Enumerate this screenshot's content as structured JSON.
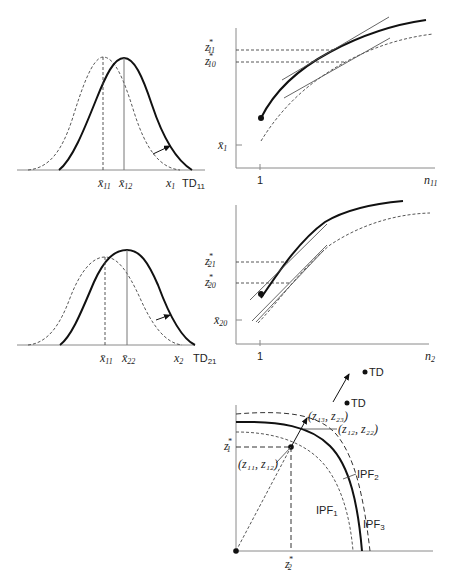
{
  "panels": {
    "distribution_1": {
      "labels": {
        "mean_old": "x̄",
        "mean_old_sub": "11",
        "mean_new": "x̄",
        "mean_new_sub": "12",
        "axis_var": "x",
        "axis_var_sub": "1",
        "td": "TD",
        "td_sub": "11"
      }
    },
    "response_1": {
      "labels": {
        "z_high": "z",
        "z_high_sup": "*",
        "z_high_sub": "11",
        "z_low": "z",
        "z_low_sup": "*",
        "z_low_sub": "10",
        "x_bar": "x̄",
        "x_bar_sub": "1",
        "tick_one": "1",
        "x_axis": "n",
        "x_axis_sub": "11"
      }
    },
    "distribution_2": {
      "labels": {
        "mean_old": "x̄",
        "mean_old_sub": "11",
        "mean_new": "x̄",
        "mean_new_sub": "22",
        "axis_var": "x",
        "axis_var_sub": "2",
        "td": "TD",
        "td_sub": "21"
      }
    },
    "response_2": {
      "labels": {
        "z_high": "z",
        "z_high_sup": "*",
        "z_high_sub": "21",
        "z_low": "z",
        "z_low_sup": "*",
        "z_low_sub": "20",
        "x_bar": "x̄",
        "x_bar_sub": "20",
        "tick_one": "1",
        "x_axis": "n",
        "x_axis_sub": "2"
      }
    },
    "frontier": {
      "labels": {
        "td_outer": "TD",
        "td_inner": "TD",
        "point_13_23": "(z₁₃, z₂₃)",
        "point_12_22": "(z₁₂, z₂₂)",
        "point_11_12": "(z₁₁, z₁₂)",
        "z1_star": "z",
        "z1_star_sup": "*",
        "z1_star_sub": "1",
        "z2_star": "z",
        "z2_star_sup": "*",
        "z2_star_sub": "2",
        "ipf1": "IPF",
        "ipf1_sub": "1",
        "ipf2": "IPF",
        "ipf2_sub": "2",
        "ipf3": "IPF",
        "ipf3_sub": "3"
      }
    }
  }
}
